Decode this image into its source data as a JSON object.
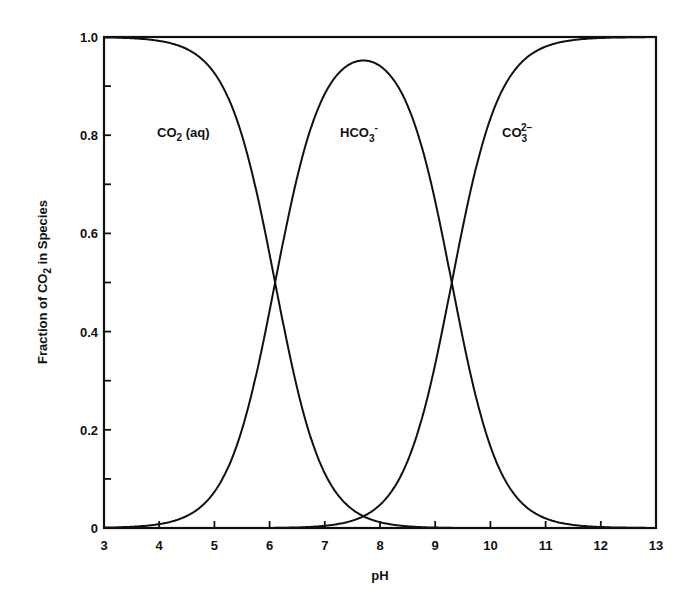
{
  "chart_data": {
    "type": "line",
    "title": "",
    "xlabel": "pH",
    "ylabel": "Fraction of CO2 in Species",
    "ylabel_parts": {
      "pre": "Fraction of CO",
      "sub": "2",
      "post": " in Species"
    },
    "xlim": [
      3,
      13
    ],
    "ylim": [
      0,
      1.0
    ],
    "grid": false,
    "legend": "inline labels",
    "x_ticks": [
      3,
      4,
      5,
      6,
      7,
      8,
      9,
      10,
      11,
      12,
      13
    ],
    "x_tick_labels": [
      "3",
      "4",
      "5",
      "6",
      "7",
      "8",
      "9",
      "10",
      "11",
      "12",
      "13"
    ],
    "y_ticks": [
      0,
      0.1,
      0.2,
      0.3,
      0.4,
      0.5,
      0.6,
      0.7,
      0.8,
      0.9,
      1.0
    ],
    "y_tick_labels": {
      "0": "0",
      "0.2": "0.2",
      "0.4": "0.4",
      "0.6": "0.6",
      "0.8": "0.8",
      "1.0": "1.0"
    },
    "pKa1": 6.1,
    "pKa2": 9.3,
    "x": [
      3,
      4,
      5,
      6,
      6.1,
      7,
      7.7,
      8,
      9,
      9.3,
      10,
      11,
      12,
      13
    ],
    "series": [
      {
        "name": "CO2 (aq)",
        "label": {
          "main": "CO",
          "sub": "2",
          "tail": " (aq)"
        },
        "values": [
          1.0,
          0.99,
          0.93,
          0.56,
          0.5,
          0.11,
          0.025,
          0.012,
          0.001,
          0.0,
          0.0,
          0.0,
          0.0,
          0.0
        ]
      },
      {
        "name": "HCO3-",
        "label": {
          "main": "HCO",
          "sub": "3",
          "sup": "-"
        },
        "values": [
          0.0,
          0.01,
          0.07,
          0.44,
          0.5,
          0.88,
          0.95,
          0.94,
          0.66,
          0.5,
          0.17,
          0.02,
          0.002,
          0.0
        ]
      },
      {
        "name": "CO3 2-",
        "label": {
          "main": "CO",
          "sub": "3",
          "sup": "2−"
        },
        "values": [
          0.0,
          0.0,
          0.0,
          0.0,
          0.0,
          0.005,
          0.025,
          0.05,
          0.33,
          0.5,
          0.83,
          0.98,
          1.0,
          1.0
        ]
      }
    ]
  }
}
